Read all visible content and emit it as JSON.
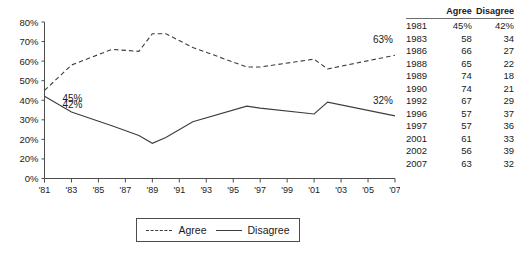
{
  "chart_data": {
    "type": "line",
    "title": "",
    "xlabel": "",
    "ylabel": "",
    "ylim": [
      0,
      80
    ],
    "grid": false,
    "legend_position": "bottom",
    "x": [
      1981,
      1983,
      1986,
      1988,
      1989,
      1990,
      1992,
      1996,
      1997,
      2001,
      2002,
      2007
    ],
    "x_tick_labels": [
      "'81",
      "'83",
      "'85",
      "'87",
      "'89",
      "'91",
      "'93",
      "'95",
      "'97",
      "'99",
      "'01",
      "'03",
      "'05",
      "'07"
    ],
    "x_tick_values": [
      1981,
      1983,
      1985,
      1987,
      1989,
      1991,
      1993,
      1995,
      1997,
      1999,
      2001,
      2003,
      2005,
      2007
    ],
    "y_tick_labels": [
      "80%",
      "70%",
      "60%",
      "50%",
      "40%",
      "30%",
      "20%",
      "20%",
      "0%"
    ],
    "y_tick_values": [
      80,
      70,
      60,
      50,
      40,
      30,
      20,
      10,
      0
    ],
    "series": [
      {
        "name": "Agree",
        "style": "dashed",
        "color": "#3d3d3d",
        "values": [
          45,
          58,
          66,
          65,
          74,
          74,
          67,
          57,
          57,
          61,
          56,
          63
        ]
      },
      {
        "name": "Disagree",
        "style": "solid",
        "color": "#3d3d3d",
        "values": [
          42,
          34,
          27,
          22,
          18,
          21,
          29,
          37,
          36,
          33,
          39,
          32
        ]
      }
    ],
    "annotations": [
      {
        "text": "45%",
        "series": "Agree",
        "x": 1981,
        "y": 45,
        "position": "right"
      },
      {
        "text": "42%",
        "series": "Disagree",
        "x": 1981,
        "y": 42,
        "position": "right"
      },
      {
        "text": "63%",
        "series": "Agree",
        "x": 2007,
        "y": 63,
        "position": "above"
      },
      {
        "text": "32%",
        "series": "Disagree",
        "x": 2007,
        "y": 32,
        "position": "above"
      }
    ]
  },
  "legend": {
    "agree_label": "Agree",
    "disagree_label": "Disagree"
  },
  "table": {
    "headers": {
      "year": "",
      "agree": "Agree",
      "disagree": "Disagree"
    },
    "rows": [
      {
        "year": "1981",
        "agree": "45%",
        "disagree": "42%"
      },
      {
        "year": "1983",
        "agree": "58",
        "disagree": "34"
      },
      {
        "year": "1986",
        "agree": "66",
        "disagree": "27"
      },
      {
        "year": "1988",
        "agree": "65",
        "disagree": "22"
      },
      {
        "year": "1989",
        "agree": "74",
        "disagree": "18"
      },
      {
        "year": "1990",
        "agree": "74",
        "disagree": "21"
      },
      {
        "year": "1992",
        "agree": "67",
        "disagree": "29"
      },
      {
        "year": "1996",
        "agree": "57",
        "disagree": "37"
      },
      {
        "year": "1997",
        "agree": "57",
        "disagree": "36"
      },
      {
        "year": "2001",
        "agree": "61",
        "disagree": "33"
      },
      {
        "year": "2002",
        "agree": "56",
        "disagree": "39"
      },
      {
        "year": "2007",
        "agree": "63",
        "disagree": "32"
      }
    ]
  }
}
